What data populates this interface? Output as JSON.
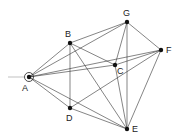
{
  "diagram": {
    "type": "graph",
    "nodes": [
      {
        "id": "A",
        "label": "A",
        "x": 29,
        "y": 77,
        "label_x": 22,
        "label_y": 91,
        "start": true
      },
      {
        "id": "B",
        "label": "B",
        "x": 70,
        "y": 43,
        "label_x": 65,
        "label_y": 37
      },
      {
        "id": "G",
        "label": "G",
        "x": 127,
        "y": 22,
        "label_x": 123,
        "label_y": 16
      },
      {
        "id": "F",
        "label": "F",
        "x": 161,
        "y": 50,
        "label_x": 166,
        "label_y": 53
      },
      {
        "id": "C",
        "label": "C",
        "x": 115,
        "y": 65,
        "label_x": 117,
        "label_y": 74
      },
      {
        "id": "D",
        "label": "D",
        "x": 70,
        "y": 108,
        "label_x": 66,
        "label_y": 121
      },
      {
        "id": "E",
        "label": "E",
        "x": 127,
        "y": 129,
        "label_x": 132,
        "label_y": 132
      }
    ],
    "edges": [
      [
        "A",
        "B"
      ],
      [
        "A",
        "G"
      ],
      [
        "A",
        "C"
      ],
      [
        "A",
        "F"
      ],
      [
        "A",
        "D"
      ],
      [
        "A",
        "E"
      ],
      [
        "B",
        "G"
      ],
      [
        "B",
        "C"
      ],
      [
        "B",
        "D"
      ],
      [
        "B",
        "E"
      ],
      [
        "G",
        "F"
      ],
      [
        "G",
        "C"
      ],
      [
        "G",
        "E"
      ],
      [
        "C",
        "F"
      ],
      [
        "C",
        "E"
      ],
      [
        "D",
        "F"
      ],
      [
        "D",
        "E"
      ],
      [
        "F",
        "E"
      ]
    ],
    "colors": {
      "line": "#333333",
      "node": "#111111",
      "background": "#ffffff"
    }
  }
}
